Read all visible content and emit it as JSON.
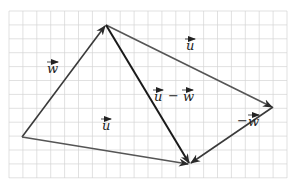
{
  "diagram": {
    "colors": {
      "grid": "#d4d4d4",
      "vector_w": "#3a3a3a",
      "vector_u": "#555555",
      "vector_diff": "#1a1a1a",
      "label": "#222222"
    },
    "labels": {
      "w": "w",
      "u_top": "u",
      "u_bottom": "u",
      "u_minus_w_u": "u",
      "u_minus_w_op": "−",
      "u_minus_w_w": "w",
      "neg_w_sign": "−",
      "neg_w": "w"
    },
    "vectors": [
      {
        "name": "w",
        "from": "A",
        "to": "B"
      },
      {
        "name": "u",
        "from": "B",
        "to": "C"
      },
      {
        "name": "u",
        "from": "A",
        "to": "D"
      },
      {
        "name": "-w",
        "from": "C",
        "to": "D"
      },
      {
        "name": "u - w",
        "from": "B",
        "to": "D"
      }
    ]
  }
}
